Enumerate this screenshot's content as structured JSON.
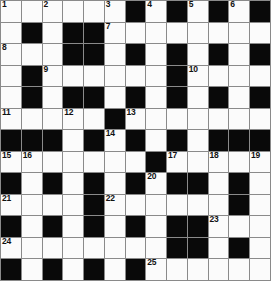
{
  "puzzle": {
    "kind": "crossword-grid",
    "rows": 13,
    "columns": 13,
    "colors": {
      "block": "#090909",
      "cell": "#fbfbfb",
      "grid_line": "#8a8a8a",
      "number_text": "#111111"
    },
    "legend": {
      "block_symbol": "black-square",
      "open_symbol": "white-square"
    },
    "clue_numbers_present": [
      1,
      2,
      3,
      4,
      5,
      6,
      7,
      8,
      9,
      10,
      11,
      12,
      13,
      14,
      15,
      16,
      17,
      18,
      19,
      20,
      21,
      22,
      23,
      24,
      25
    ],
    "grid": [
      [
        {
          "type": "white",
          "number": "1"
        },
        {
          "type": "white",
          "number": ""
        },
        {
          "type": "white",
          "number": "2"
        },
        {
          "type": "white",
          "number": ""
        },
        {
          "type": "white",
          "number": ""
        },
        {
          "type": "white",
          "number": "3"
        },
        {
          "type": "black",
          "number": ""
        },
        {
          "type": "white",
          "number": "4"
        },
        {
          "type": "black",
          "number": ""
        },
        {
          "type": "white",
          "number": "5"
        },
        {
          "type": "black",
          "number": ""
        },
        {
          "type": "white",
          "number": "6"
        },
        {
          "type": "black",
          "number": ""
        }
      ],
      [
        {
          "type": "white",
          "number": ""
        },
        {
          "type": "black",
          "number": ""
        },
        {
          "type": "white",
          "number": ""
        },
        {
          "type": "black",
          "number": ""
        },
        {
          "type": "black",
          "number": ""
        },
        {
          "type": "white",
          "number": "7"
        },
        {
          "type": "white",
          "number": ""
        },
        {
          "type": "white",
          "number": ""
        },
        {
          "type": "white",
          "number": ""
        },
        {
          "type": "white",
          "number": ""
        },
        {
          "type": "white",
          "number": ""
        },
        {
          "type": "white",
          "number": ""
        },
        {
          "type": "white",
          "number": ""
        }
      ],
      [
        {
          "type": "white",
          "number": "8"
        },
        {
          "type": "white",
          "number": ""
        },
        {
          "type": "white",
          "number": ""
        },
        {
          "type": "black",
          "number": ""
        },
        {
          "type": "black",
          "number": ""
        },
        {
          "type": "white",
          "number": ""
        },
        {
          "type": "black",
          "number": ""
        },
        {
          "type": "white",
          "number": ""
        },
        {
          "type": "black",
          "number": ""
        },
        {
          "type": "white",
          "number": ""
        },
        {
          "type": "black",
          "number": ""
        },
        {
          "type": "white",
          "number": ""
        },
        {
          "type": "black",
          "number": ""
        }
      ],
      [
        {
          "type": "white",
          "number": ""
        },
        {
          "type": "black",
          "number": ""
        },
        {
          "type": "white",
          "number": "9"
        },
        {
          "type": "white",
          "number": ""
        },
        {
          "type": "white",
          "number": ""
        },
        {
          "type": "white",
          "number": ""
        },
        {
          "type": "white",
          "number": ""
        },
        {
          "type": "white",
          "number": ""
        },
        {
          "type": "black",
          "number": ""
        },
        {
          "type": "white",
          "number": "10"
        },
        {
          "type": "white",
          "number": ""
        },
        {
          "type": "white",
          "number": ""
        },
        {
          "type": "white",
          "number": ""
        }
      ],
      [
        {
          "type": "white",
          "number": ""
        },
        {
          "type": "black",
          "number": ""
        },
        {
          "type": "white",
          "number": ""
        },
        {
          "type": "black",
          "number": ""
        },
        {
          "type": "black",
          "number": ""
        },
        {
          "type": "white",
          "number": ""
        },
        {
          "type": "black",
          "number": ""
        },
        {
          "type": "white",
          "number": ""
        },
        {
          "type": "black",
          "number": ""
        },
        {
          "type": "white",
          "number": ""
        },
        {
          "type": "black",
          "number": ""
        },
        {
          "type": "white",
          "number": ""
        },
        {
          "type": "black",
          "number": ""
        }
      ],
      [
        {
          "type": "white",
          "number": "11"
        },
        {
          "type": "white",
          "number": ""
        },
        {
          "type": "white",
          "number": ""
        },
        {
          "type": "white",
          "number": "12"
        },
        {
          "type": "white",
          "number": ""
        },
        {
          "type": "black",
          "number": ""
        },
        {
          "type": "white",
          "number": "13"
        },
        {
          "type": "white",
          "number": ""
        },
        {
          "type": "white",
          "number": ""
        },
        {
          "type": "white",
          "number": ""
        },
        {
          "type": "white",
          "number": ""
        },
        {
          "type": "white",
          "number": ""
        },
        {
          "type": "white",
          "number": ""
        }
      ],
      [
        {
          "type": "black",
          "number": ""
        },
        {
          "type": "black",
          "number": ""
        },
        {
          "type": "black",
          "number": ""
        },
        {
          "type": "white",
          "number": ""
        },
        {
          "type": "black",
          "number": ""
        },
        {
          "type": "white",
          "number": "14"
        },
        {
          "type": "black",
          "number": ""
        },
        {
          "type": "white",
          "number": ""
        },
        {
          "type": "black",
          "number": ""
        },
        {
          "type": "white",
          "number": ""
        },
        {
          "type": "black",
          "number": ""
        },
        {
          "type": "black",
          "number": ""
        },
        {
          "type": "black",
          "number": ""
        }
      ],
      [
        {
          "type": "white",
          "number": "15"
        },
        {
          "type": "white",
          "number": "16"
        },
        {
          "type": "white",
          "number": ""
        },
        {
          "type": "white",
          "number": ""
        },
        {
          "type": "white",
          "number": ""
        },
        {
          "type": "white",
          "number": ""
        },
        {
          "type": "white",
          "number": ""
        },
        {
          "type": "black",
          "number": ""
        },
        {
          "type": "white",
          "number": "17"
        },
        {
          "type": "white",
          "number": ""
        },
        {
          "type": "white",
          "number": "18"
        },
        {
          "type": "white",
          "number": ""
        },
        {
          "type": "white",
          "number": "19"
        }
      ],
      [
        {
          "type": "black",
          "number": ""
        },
        {
          "type": "white",
          "number": ""
        },
        {
          "type": "black",
          "number": ""
        },
        {
          "type": "white",
          "number": ""
        },
        {
          "type": "black",
          "number": ""
        },
        {
          "type": "white",
          "number": ""
        },
        {
          "type": "black",
          "number": ""
        },
        {
          "type": "white",
          "number": "20"
        },
        {
          "type": "black",
          "number": ""
        },
        {
          "type": "black",
          "number": ""
        },
        {
          "type": "white",
          "number": ""
        },
        {
          "type": "black",
          "number": ""
        },
        {
          "type": "white",
          "number": ""
        }
      ],
      [
        {
          "type": "white",
          "number": "21"
        },
        {
          "type": "white",
          "number": ""
        },
        {
          "type": "white",
          "number": ""
        },
        {
          "type": "white",
          "number": ""
        },
        {
          "type": "black",
          "number": ""
        },
        {
          "type": "white",
          "number": "22"
        },
        {
          "type": "white",
          "number": ""
        },
        {
          "type": "white",
          "number": ""
        },
        {
          "type": "white",
          "number": ""
        },
        {
          "type": "white",
          "number": ""
        },
        {
          "type": "white",
          "number": ""
        },
        {
          "type": "black",
          "number": ""
        },
        {
          "type": "white",
          "number": ""
        }
      ],
      [
        {
          "type": "black",
          "number": ""
        },
        {
          "type": "white",
          "number": ""
        },
        {
          "type": "black",
          "number": ""
        },
        {
          "type": "white",
          "number": ""
        },
        {
          "type": "black",
          "number": ""
        },
        {
          "type": "white",
          "number": ""
        },
        {
          "type": "black",
          "number": ""
        },
        {
          "type": "white",
          "number": ""
        },
        {
          "type": "black",
          "number": ""
        },
        {
          "type": "black",
          "number": ""
        },
        {
          "type": "white",
          "number": "23"
        },
        {
          "type": "white",
          "number": ""
        },
        {
          "type": "white",
          "number": ""
        }
      ],
      [
        {
          "type": "white",
          "number": "24"
        },
        {
          "type": "white",
          "number": ""
        },
        {
          "type": "white",
          "number": ""
        },
        {
          "type": "white",
          "number": ""
        },
        {
          "type": "white",
          "number": ""
        },
        {
          "type": "white",
          "number": ""
        },
        {
          "type": "white",
          "number": ""
        },
        {
          "type": "white",
          "number": ""
        },
        {
          "type": "black",
          "number": ""
        },
        {
          "type": "black",
          "number": ""
        },
        {
          "type": "white",
          "number": ""
        },
        {
          "type": "black",
          "number": ""
        },
        {
          "type": "white",
          "number": ""
        }
      ],
      [
        {
          "type": "black",
          "number": ""
        },
        {
          "type": "white",
          "number": ""
        },
        {
          "type": "black",
          "number": ""
        },
        {
          "type": "white",
          "number": ""
        },
        {
          "type": "black",
          "number": ""
        },
        {
          "type": "white",
          "number": ""
        },
        {
          "type": "black",
          "number": ""
        },
        {
          "type": "white",
          "number": "25"
        },
        {
          "type": "white",
          "number": ""
        },
        {
          "type": "white",
          "number": ""
        },
        {
          "type": "white",
          "number": ""
        },
        {
          "type": "white",
          "number": ""
        },
        {
          "type": "white",
          "number": ""
        }
      ]
    ]
  }
}
